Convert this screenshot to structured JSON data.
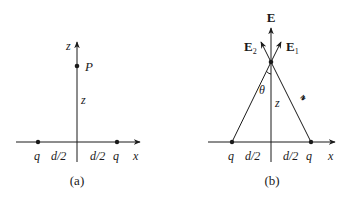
{
  "panels": [
    {
      "id": "a",
      "caption": "(a)",
      "axis_labels": {
        "x": "x",
        "z": "z"
      },
      "point_label": "P",
      "height_label": "z",
      "charges": [
        {
          "label": "q"
        },
        {
          "label": "q"
        }
      ],
      "half_distance_labels": [
        "d/2",
        "d/2"
      ]
    },
    {
      "id": "b",
      "caption": "(b)",
      "axis_labels": {
        "x": "x"
      },
      "field_labels": {
        "net": "E",
        "e1": "E",
        "e1_sub": "1",
        "e2": "E",
        "e2_sub": "2"
      },
      "angle_label": "θ",
      "height_label": "z",
      "distance_label": "𝓇",
      "charges": [
        {
          "label": "q"
        },
        {
          "label": "q"
        }
      ],
      "half_distance_labels": [
        "d/2",
        "d/2"
      ]
    }
  ]
}
